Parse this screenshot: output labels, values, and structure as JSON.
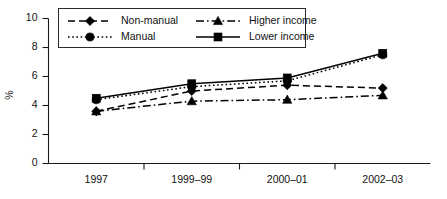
{
  "chart_data": {
    "type": "line",
    "title": "",
    "xlabel": "",
    "ylabel": "%",
    "categories": [
      "1997",
      "1999–99",
      "2000–01",
      "2002–03"
    ],
    "ylim": [
      0,
      10
    ],
    "yticks": [
      0,
      2,
      4,
      6,
      8,
      10
    ],
    "ytick_labels": [
      "0",
      "2",
      "4",
      "6",
      "8",
      "10"
    ],
    "grid": false,
    "legend_position": "top-inside",
    "series": [
      {
        "name": "Non-manual",
        "marker": "diamond",
        "line_style": "dashed",
        "color": "#000000",
        "values": [
          3.6,
          5.0,
          5.4,
          5.2
        ]
      },
      {
        "name": "Manual",
        "marker": "circle",
        "line_style": "dotted",
        "color": "#000000",
        "values": [
          4.4,
          5.3,
          5.7,
          7.5
        ]
      },
      {
        "name": "Higher income",
        "marker": "triangle",
        "line_style": "dash-dot",
        "color": "#000000",
        "values": [
          3.6,
          4.3,
          4.4,
          4.7
        ]
      },
      {
        "name": "Lower income",
        "marker": "square",
        "line_style": "solid",
        "color": "#000000",
        "values": [
          4.5,
          5.5,
          5.9,
          7.6
        ]
      }
    ]
  },
  "legend": {
    "entries": [
      {
        "label": "Non-manual"
      },
      {
        "label": "Higher income"
      },
      {
        "label": "Manual"
      },
      {
        "label": "Lower income"
      }
    ]
  },
  "axis": {
    "y_title": "%",
    "y_labels": [
      "10",
      "8",
      "6",
      "4",
      "2",
      "0"
    ],
    "x_labels": [
      "1997",
      "1999–99",
      "2000–01",
      "2002–03"
    ]
  }
}
